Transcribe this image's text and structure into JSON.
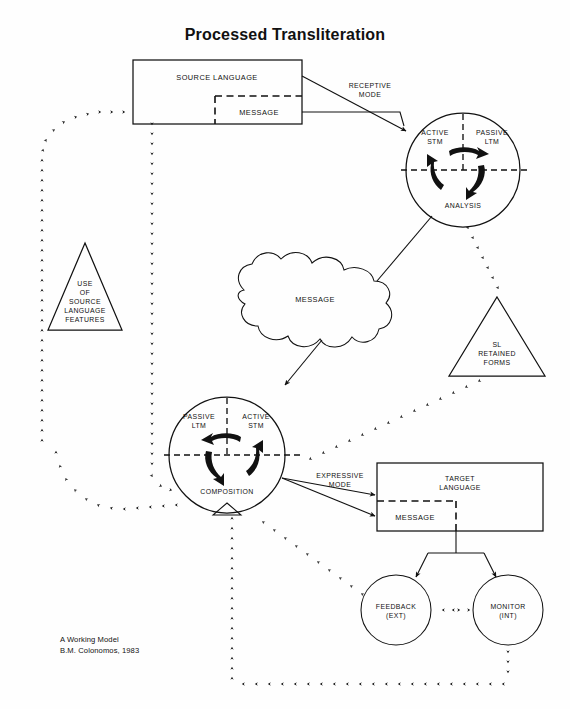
{
  "title": "Processed Transliteration",
  "caption": {
    "line1": "A Working Model",
    "line2": "B.M. Colonomos, 1983"
  },
  "nodes": {
    "source_language": {
      "label": "SOURCE LANGUAGE",
      "message_label": "MESSAGE"
    },
    "target_language": {
      "label_line1": "TARGET",
      "label_line2": "LANGUAGE",
      "message_label": "MESSAGE"
    },
    "analysis_circle": {
      "active_stm_line1": "ACTIVE",
      "active_stm_line2": "STM",
      "passive_ltm_line1": "PASSIVE",
      "passive_ltm_line2": "LTM",
      "bottom_label": "ANALYSIS"
    },
    "composition_circle": {
      "passive_ltm_line1": "PASSIVE",
      "passive_ltm_line2": "LTM",
      "active_stm_line1": "ACTIVE",
      "active_stm_line2": "STM",
      "bottom_label": "COMPOSITION"
    },
    "source_features_triangle": {
      "line1": "USE",
      "line2": "OF",
      "line3": "SOURCE",
      "line4": "LANGUAGE",
      "line5": "FEATURES"
    },
    "sl_retained_triangle": {
      "line1": "SL",
      "line2": "RETAINED",
      "line3": "FORMS"
    },
    "message_blob": {
      "label": "MESSAGE"
    },
    "feedback_circle": {
      "line1": "FEEDBACK",
      "line2": "(EXT)"
    },
    "monitor_circle": {
      "line1": "MONITOR",
      "line2": "(INT)"
    }
  },
  "edge_labels": {
    "receptive_mode_line1": "RECEPTIVE",
    "receptive_mode_line2": "MODE",
    "expressive_mode_line1": "EXPRESSIVE",
    "expressive_mode_line2": "MODE"
  },
  "colors": {
    "ink": "#111111",
    "paper": "#fefefe"
  }
}
